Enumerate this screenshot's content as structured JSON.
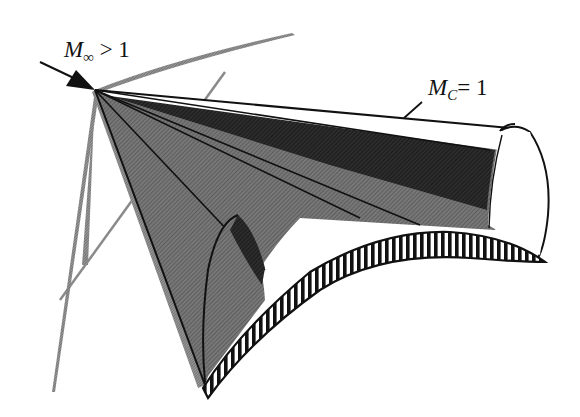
{
  "figure": {
    "labels": {
      "freestream": {
        "symbol": "M",
        "subscript": "∞",
        "relation": " > 1"
      },
      "sonic": {
        "symbol": "M",
        "subscript": "C",
        "relation": "= 1"
      }
    },
    "colors": {
      "background": "#ffffff",
      "ink": "#111111",
      "dark_fill": "#2b2b2b",
      "mid_fill": "#6e6e6e",
      "light_fill": "#8f8f8f",
      "line_gray": "#8a8a8a"
    }
  }
}
